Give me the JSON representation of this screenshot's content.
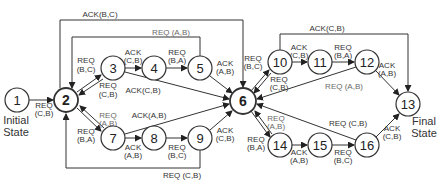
{
  "diagram": {
    "type": "state-transition",
    "nodes": [
      {
        "id": "1",
        "label": "1",
        "x": 17,
        "y": 100
      },
      {
        "id": "2",
        "label": "2",
        "x": 66,
        "y": 100
      },
      {
        "id": "3",
        "label": "3",
        "x": 113,
        "y": 68
      },
      {
        "id": "4",
        "label": "4",
        "x": 154,
        "y": 68
      },
      {
        "id": "5",
        "label": "5",
        "x": 200,
        "y": 68
      },
      {
        "id": "6",
        "label": "6",
        "x": 243,
        "y": 101
      },
      {
        "id": "7",
        "label": "7",
        "x": 113,
        "y": 138
      },
      {
        "id": "8",
        "label": "8",
        "x": 154,
        "y": 138
      },
      {
        "id": "9",
        "label": "9",
        "x": 200,
        "y": 138
      },
      {
        "id": "10",
        "label": "10",
        "x": 280,
        "y": 62
      },
      {
        "id": "11",
        "label": "11",
        "x": 320,
        "y": 62
      },
      {
        "id": "12",
        "label": "12",
        "x": 367,
        "y": 62
      },
      {
        "id": "13",
        "label": "13",
        "x": 408,
        "y": 104
      },
      {
        "id": "14",
        "label": "14",
        "x": 280,
        "y": 145
      },
      {
        "id": "15",
        "label": "15",
        "x": 320,
        "y": 145
      },
      {
        "id": "16",
        "label": "16",
        "x": 367,
        "y": 145
      }
    ],
    "captions": {
      "initial_line1": "Initial",
      "initial_line2": "State",
      "final_line1": "Final",
      "final_line2": "State"
    },
    "edge_labels": {
      "e1_2_a": "REQ",
      "e1_2_b": "(C,B)",
      "e2_3_a": "REQ",
      "e2_3_b": "(B,C)",
      "e3_2_a": "REQ",
      "e3_2_b": "(C,B)",
      "e3_4_a": "ACK",
      "e3_4_b": "(C,B)",
      "e4_5_a": "REQ",
      "e4_5_b": "(B,A)",
      "e5_6_a": "ACK",
      "e5_6_b": "(A,B)",
      "e3_6": "ACK(C,B)",
      "e5_2_top": "REQ (A,B)",
      "e2_6_top": "ACK(B,C)",
      "e2_7_a": "REQ",
      "e2_7_b": "(B,A)",
      "e7_2_a": "REQ",
      "e7_2_b": "(A,B)",
      "e7_6": "ACK(A,B)",
      "e7_8_a": "ACK",
      "e7_8_b": "(A,B)",
      "e8_9_a": "REQ",
      "e8_9_b": "(B,C)",
      "e9_6_a": "ACK",
      "e9_6_b": "(C,B)",
      "e9_2_bottom": "REQ (C,B)",
      "e6_10_a": "REQ",
      "e6_10_b": "(B,C)",
      "e10_6_a": "REQ",
      "e10_6_b": "(C,B)",
      "e10_11_a": "ACK",
      "e10_11_b": "(C,B)",
      "e11_12_a": "REQ",
      "e11_12_b": "(B,A)",
      "e12_13_a": "ACK",
      "e12_13_b": "(A,B)",
      "e12_6": "REQ (A,B)",
      "e10_13_top": "ACK(C,B)",
      "e6_14_a": "REQ",
      "e6_14_b": "(B,A)",
      "e14_6_a": "REQ",
      "e14_6_b": "(A,B)",
      "e14_15_a": "ACK",
      "e14_15_b": "(A,B)",
      "e15_16_a": "REQ",
      "e15_16_b": "(B,C)",
      "e16_6": "REQ (C,B)",
      "e16_13_a": "ACK",
      "e16_13_b": "(C,B)"
    }
  }
}
